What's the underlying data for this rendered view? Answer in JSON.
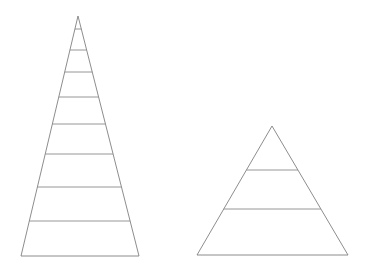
{
  "canvas": {
    "width": 365,
    "height": 268,
    "background_color": "#ffffff"
  },
  "style": {
    "outline_color": "#808080",
    "divider_color": "#8a8a8a",
    "fill": "none",
    "stroke_width": 0.9
  },
  "chart_data": {
    "type": "diagram",
    "subtype": "pyramid-outline-pair",
    "title": "",
    "xlabel": "",
    "ylabel": "",
    "grid": false,
    "legend": null,
    "annotations": [],
    "shapes": [
      {
        "name": "left-pyramid",
        "level_count": 9,
        "apex": {
          "x": 78,
          "y": 16
        },
        "base_left": {
          "x": 21,
          "y": 256
        },
        "base_right": {
          "x": 139,
          "y": 256
        },
        "base_width": 118,
        "height": 240,
        "divider_y": [
          29,
          50,
          72,
          97,
          124,
          154,
          187,
          221
        ],
        "labels": []
      },
      {
        "name": "right-pyramid",
        "level_count": 3,
        "apex": {
          "x": 272,
          "y": 126
        },
        "base_left": {
          "x": 197,
          "y": 255
        },
        "base_right": {
          "x": 348,
          "y": 255
        },
        "base_width": 151,
        "height": 129,
        "divider_y": [
          170,
          209
        ],
        "labels": []
      }
    ]
  }
}
